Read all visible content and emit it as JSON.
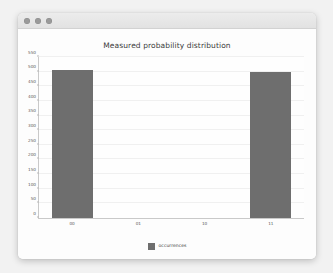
{
  "window": {
    "controls": [
      {
        "name": "close-button",
        "color": "#9a9a9a"
      },
      {
        "name": "minimize-button",
        "color": "#9a9a9a"
      },
      {
        "name": "zoom-button",
        "color": "#9a9a9a"
      }
    ]
  },
  "legend": {
    "label": "occurrences",
    "swatch_color": "#6e6e6e",
    "position": "bottom-center"
  },
  "chart_data": {
    "type": "bar",
    "title": "Measured probability distribution",
    "xlabel": "",
    "ylabel": "",
    "categories": [
      "00",
      "01",
      "10",
      "11"
    ],
    "values": [
      505,
      0,
      0,
      500
    ],
    "series": [
      {
        "name": "occurrences",
        "values": [
          505,
          0,
          0,
          500
        ]
      }
    ],
    "ylim": [
      0,
      550
    ],
    "yticks": [
      0,
      50,
      100,
      150,
      200,
      250,
      300,
      350,
      400,
      450,
      500,
      550
    ],
    "ytick_labels": [
      "0",
      "50",
      "100",
      "150",
      "200",
      "250",
      "300",
      "350",
      "400",
      "450",
      "500",
      "550"
    ],
    "grid": true,
    "bar_color": "#6e6e6e",
    "background": "#fefefe"
  }
}
